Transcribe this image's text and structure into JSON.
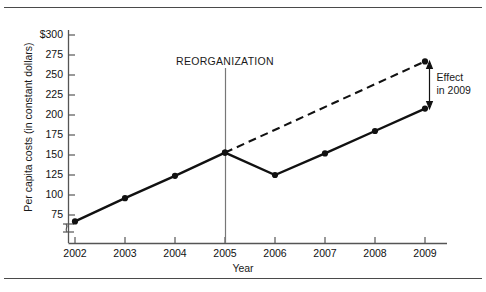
{
  "figure": {
    "rule_top": "horizontal-rule",
    "rule_bottom": "horizontal-rule"
  },
  "chart_data": {
    "type": "line",
    "title": "",
    "xlabel": "Year",
    "ylabel": "Per capita costs (in constant dollars)",
    "categories": [
      "2002",
      "2003",
      "2004",
      "2005",
      "2006",
      "2007",
      "2008",
      "2009"
    ],
    "x": [
      2002,
      2003,
      2004,
      2005,
      2006,
      2007,
      2008,
      2009
    ],
    "xlim": [
      2002,
      2009
    ],
    "ylim": [
      75,
      300
    ],
    "yticks": [
      75,
      100,
      125,
      150,
      175,
      200,
      225,
      250,
      275,
      300
    ],
    "ytick_labels": [
      "75",
      "100",
      "125",
      "150",
      "175",
      "200",
      "225",
      "250",
      "275",
      "$300"
    ],
    "xtick_labels": [
      "2002",
      "2003",
      "2004",
      "2005",
      "2006",
      "2007",
      "2008",
      "2009"
    ],
    "grid": false,
    "legend": false,
    "y_axis_break": true,
    "series": [
      {
        "name": "Actual per capita costs",
        "style": "solid",
        "marker": "filled-circle",
        "x": [
          2002,
          2003,
          2004,
          2005,
          2006,
          2007,
          2008,
          2009
        ],
        "values": [
          67,
          96,
          124,
          153,
          125,
          152,
          180,
          208
        ]
      },
      {
        "name": "Projected trend without reorganization",
        "style": "dashed",
        "marker": "filled-circle",
        "x": [
          2005,
          2009
        ],
        "values": [
          153,
          267
        ]
      }
    ],
    "annotations": [
      {
        "name": "reorganization-marker",
        "label": "REORGANIZATION",
        "x": 2005,
        "type": "vertical-line"
      },
      {
        "name": "effect-annotation",
        "label_line1": "Effect",
        "label_line2": "in 2009",
        "x": 2009,
        "y_from": 208,
        "y_to": 267,
        "type": "double-headed-arrow"
      }
    ]
  },
  "axis_labels": {
    "y": [
      {
        "value": 300,
        "text": "$300"
      },
      {
        "value": 275,
        "text": "275"
      },
      {
        "value": 250,
        "text": "250"
      },
      {
        "value": 225,
        "text": "225"
      },
      {
        "value": 200,
        "text": "200"
      },
      {
        "value": 175,
        "text": "175"
      },
      {
        "value": 150,
        "text": "150"
      },
      {
        "value": 125,
        "text": "125"
      },
      {
        "value": 100,
        "text": "100"
      },
      {
        "value": 75,
        "text": "75"
      }
    ],
    "x": [
      {
        "value": 2002,
        "text": "2002"
      },
      {
        "value": 2003,
        "text": "2003"
      },
      {
        "value": 2004,
        "text": "2004"
      },
      {
        "value": 2005,
        "text": "2005"
      },
      {
        "value": 2006,
        "text": "2006"
      },
      {
        "value": 2007,
        "text": "2007"
      },
      {
        "value": 2008,
        "text": "2008"
      },
      {
        "value": 2009,
        "text": "2009"
      }
    ]
  },
  "colors": {
    "ink": "#111111",
    "axis": "#555555",
    "rule": "#4a4a4a",
    "background": "#ffffff"
  }
}
